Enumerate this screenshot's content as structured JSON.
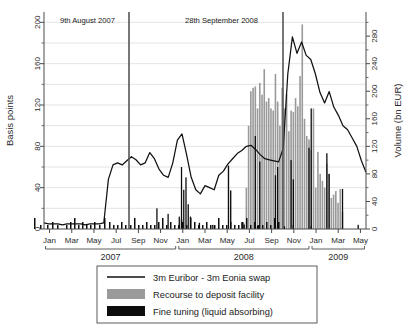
{
  "chart_data": {
    "type": "line",
    "title": "",
    "subtitle": "",
    "xlabel": "",
    "ylabel": "Basis points",
    "y2label": "Volume (bn EUR)",
    "ylim": [
      0,
      210
    ],
    "y2lim": [
      0,
      315
    ],
    "xlim": [
      "2007-01-01",
      "2009-05-15"
    ],
    "grid": true,
    "legend_position": "below-axes",
    "yticks": [
      0,
      40,
      80,
      120,
      160,
      200
    ],
    "y2ticks": [
      0,
      40,
      80,
      120,
      160,
      200,
      240,
      280
    ],
    "xticks": [
      "Jan",
      "Mar",
      "May",
      "Jul",
      "Sep",
      "Nov",
      "Jan",
      "Mar",
      "May",
      "Jul",
      "Sep",
      "Nov",
      "Jan",
      "Mar",
      "May"
    ],
    "xtick_years": [
      "2007",
      "2008",
      "2009"
    ],
    "annotations": [
      {
        "text": "9th August 2007",
        "x": "2007-08-09",
        "type": "vertical-line"
      },
      {
        "text": "28th September 2008",
        "x": "2008-09-28",
        "type": "vertical-line"
      }
    ],
    "legend": [
      {
        "label": "3m Euribor - 3m Eonia swap",
        "marker": "line",
        "color": "#111111"
      },
      {
        "label": "Recourse to deposit facility",
        "marker": "bar",
        "color": "#9a9a9a"
      },
      {
        "label": "Fine tuning (liquid absorbing)",
        "marker": "bar",
        "color": "#0d0d0d"
      }
    ],
    "series": [
      {
        "name": "3m Euribor - 3m Eonia swap",
        "type": "line",
        "axis": "left",
        "unit": "basis points",
        "color": "#111111",
        "x": [
          "2007-01",
          "2007-01",
          "2007-02",
          "2007-02",
          "2007-03",
          "2007-03",
          "2007-04",
          "2007-04",
          "2007-05",
          "2007-05",
          "2007-06",
          "2007-06",
          "2007-07",
          "2007-07",
          "2007-08a",
          "2007-08b",
          "2007-08c",
          "2007-08d",
          "2007-09a",
          "2007-09b",
          "2007-09c",
          "2007-10a",
          "2007-10b",
          "2007-10c",
          "2007-11a",
          "2007-11b",
          "2007-11c",
          "2007-12a",
          "2007-12b",
          "2007-12c",
          "2007-12d",
          "2008-01a",
          "2008-01b",
          "2008-01c",
          "2008-02a",
          "2008-02b",
          "2008-03a",
          "2008-03b",
          "2008-03c",
          "2008-04a",
          "2008-04b",
          "2008-05a",
          "2008-05b",
          "2008-06a",
          "2008-06b",
          "2008-07a",
          "2008-07b",
          "2008-08a",
          "2008-08b",
          "2008-09a",
          "2008-09b",
          "2008-09c",
          "2008-10a",
          "2008-10b",
          "2008-10c",
          "2008-10d",
          "2008-11a",
          "2008-11b",
          "2008-11c",
          "2008-12a",
          "2008-12b",
          "2008-12c",
          "2009-01a",
          "2009-01b",
          "2009-02a",
          "2009-02b",
          "2009-03a",
          "2009-03b",
          "2009-04a",
          "2009-04b",
          "2009-04c"
        ],
        "values": [
          6,
          5,
          5,
          5,
          4,
          5,
          5,
          5,
          5,
          4,
          5,
          5,
          5,
          6,
          48,
          62,
          64,
          62,
          66,
          70,
          67,
          62,
          64,
          74,
          68,
          58,
          52,
          50,
          64,
          86,
          92,
          72,
          50,
          38,
          34,
          42,
          40,
          38,
          52,
          56,
          63,
          68,
          73,
          76,
          80,
          81,
          77,
          72,
          68,
          67,
          66,
          65,
          78,
          150,
          186,
          170,
          181,
          168,
          164,
          150,
          132,
          122,
          133,
          118,
          110,
          100,
          96,
          88,
          80,
          66,
          55
        ]
      },
      {
        "name": "Recourse to deposit facility",
        "type": "bar",
        "axis": "right",
        "unit": "bn EUR",
        "color": "#9a9a9a",
        "values_by_week": [
          0,
          0,
          0,
          0,
          0,
          0,
          0,
          0,
          0,
          0,
          0,
          0,
          0,
          0,
          0,
          0,
          0,
          0,
          0,
          0,
          0,
          0,
          0,
          0,
          0,
          0,
          0,
          0,
          0,
          0,
          0,
          0,
          0,
          0,
          0,
          0,
          0,
          0,
          0,
          0,
          0,
          0,
          0,
          0,
          0,
          0,
          0,
          0,
          0,
          0,
          0,
          0,
          0,
          0,
          0,
          0,
          0,
          0,
          0,
          0,
          0,
          0,
          0,
          0,
          0,
          0,
          0,
          0,
          0,
          0,
          0,
          0,
          0,
          0,
          0,
          0,
          0,
          0,
          0,
          0,
          0,
          0,
          0,
          0,
          0,
          0,
          0,
          0,
          0,
          8,
          60,
          150,
          200,
          205,
          207,
          175,
          212,
          195,
          232,
          185,
          190,
          175,
          172,
          225,
          185,
          150,
          205,
          175,
          195,
          142,
          172,
          170,
          190,
          178,
          222,
          297,
          160,
          135,
          130,
          115,
          175,
          60,
          112,
          80,
          70,
          60,
          95,
          80,
          45,
          50,
          55,
          38,
          58,
          25
        ],
        "peak_value": 297,
        "peak_period": "2009-01"
      },
      {
        "name": "Fine tuning (liquid absorbing)",
        "type": "bar",
        "axis": "right",
        "unit": "bn EUR",
        "color": "#0d0d0d",
        "values_by_week": [
          0,
          0,
          0,
          0,
          0,
          0,
          0,
          0,
          0,
          0,
          0,
          0,
          0,
          0,
          0,
          0,
          0,
          0,
          0,
          0,
          0,
          0,
          0,
          0,
          0,
          0,
          0,
          0,
          0,
          0,
          0,
          0,
          0,
          0,
          0,
          0,
          0,
          0,
          0,
          0,
          0,
          0,
          0,
          0,
          0,
          0,
          0,
          0,
          0,
          0,
          0,
          0,
          0,
          0,
          0,
          0,
          0,
          0,
          0,
          0,
          0,
          14,
          0,
          0,
          0,
          18,
          0,
          0,
          0,
          9,
          0,
          0,
          0,
          0,
          0,
          6,
          0,
          0,
          0,
          0,
          0,
          0,
          92,
          56,
          0,
          0,
          0,
          0,
          10,
          6,
          0,
          0,
          0,
          0,
          0,
          5,
          0,
          0,
          0,
          0,
          0,
          0,
          0,
          5,
          0,
          0,
          0,
          4,
          0,
          0,
          0,
          6,
          0,
          0,
          0,
          0,
          0,
          0,
          0,
          4,
          0,
          0,
          0,
          0,
          0,
          0,
          0,
          0,
          0,
          0,
          0,
          0,
          0,
          0,
          0,
          0,
          0,
          0,
          0,
          0,
          6,
          0,
          0,
          0
        ],
        "notable_tall_bars": [
          92,
          56,
          135,
          100,
          90,
          80,
          78,
          72
        ]
      }
    ]
  },
  "axes": {
    "left_title": "Basis points",
    "right_title": "Volume (bn EUR)",
    "left_ticks": [
      "0",
      "40",
      "80",
      "120",
      "160",
      "200"
    ],
    "right_ticks": [
      "0",
      "40",
      "80",
      "120",
      "160",
      "200",
      "240",
      "280"
    ],
    "x_months": [
      "Jan",
      "Mar",
      "May",
      "Jul",
      "Sep",
      "Nov",
      "Jan",
      "Mar",
      "May",
      "Jul",
      "Sep",
      "Nov",
      "Jan",
      "Mar",
      "May"
    ],
    "x_years": [
      "2007",
      "2008",
      "2009"
    ]
  },
  "annotations": {
    "first": "9th August 2007",
    "second": "28th September 2008"
  },
  "legend": {
    "items": [
      {
        "label": "3m Euribor - 3m Eonia swap"
      },
      {
        "label": "Recourse to deposit facility"
      },
      {
        "label": "Fine tuning (liquid absorbing)"
      }
    ]
  },
  "colors": {
    "line": "#111111",
    "deposit_bar": "#9a9a9a",
    "fine_tuning_bar": "#0d0d0d",
    "grid": "#d9d9d9",
    "axis": "#4a4a4a",
    "marker_line": "#555555"
  }
}
